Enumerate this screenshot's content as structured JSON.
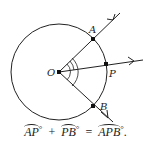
{
  "diagram": {
    "circle": {
      "cx": 59,
      "cy": 72,
      "r": 48
    },
    "points": {
      "O": {
        "label": "O",
        "x": 59,
        "y": 72
      },
      "A": {
        "label": "A",
        "x": 93,
        "y": 39
      },
      "P": {
        "label": "P",
        "x": 106,
        "y": 64
      },
      "B": {
        "label": "B",
        "x": 93,
        "y": 106
      }
    },
    "rays": [
      "OA",
      "OP",
      "OB"
    ],
    "angle_marks": 3,
    "stroke_color": "#222222"
  },
  "equation": {
    "term1": "AP",
    "term2": "PB",
    "result": "APB",
    "degree": "°",
    "plus": "+",
    "equals": "=",
    "period": "."
  }
}
